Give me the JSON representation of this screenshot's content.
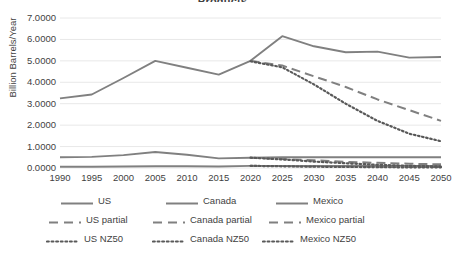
{
  "chart_data": {
    "type": "line",
    "title": "Products",
    "xlabel": "",
    "ylabel": "Billion Barrels/Year",
    "x": [
      1990,
      1995,
      2000,
      2005,
      2010,
      2015,
      2020,
      2025,
      2030,
      2035,
      2040,
      2045,
      2050
    ],
    "xtick_labels": [
      "1990",
      "1995",
      "2000",
      "2005",
      "2010",
      "2015",
      "2020",
      "2025",
      "2030",
      "2035",
      "2040",
      "2045",
      "2050"
    ],
    "ytick_labels": [
      "7.0000",
      "6.0000",
      "5.0000",
      "4.0000",
      "3.0000",
      "2.0000",
      "1.0000",
      "0.0000"
    ],
    "ytick_values": [
      7,
      6,
      5,
      4,
      3,
      2,
      1,
      0
    ],
    "ylim": [
      0,
      7
    ],
    "xlim": [
      1990,
      2050
    ],
    "grid": true,
    "legend_position": "bottom",
    "series": [
      {
        "name": "US",
        "style": "solid",
        "color": "#808080",
        "x": [
          1990,
          1995,
          2000,
          2005,
          2010,
          2015,
          2020,
          2025,
          2030,
          2035,
          2040,
          2045,
          2050
        ],
        "values": [
          3.25,
          3.43,
          4.2,
          5.0,
          4.68,
          4.36,
          5.0,
          6.15,
          5.68,
          5.4,
          5.43,
          5.15,
          5.18
        ]
      },
      {
        "name": "Canada",
        "style": "solid",
        "color": "#808080",
        "x": [
          1990,
          1995,
          2000,
          2005,
          2010,
          2015,
          2020,
          2025,
          2030,
          2035,
          2040,
          2045,
          2050
        ],
        "values": [
          0.5,
          0.52,
          0.6,
          0.75,
          0.62,
          0.45,
          0.48,
          0.5,
          0.5,
          0.5,
          0.5,
          0.5,
          0.5
        ]
      },
      {
        "name": "Mexico",
        "style": "solid",
        "color": "#808080",
        "x": [
          1990,
          1995,
          2000,
          2005,
          2010,
          2015,
          2020,
          2025,
          2030,
          2035,
          2040,
          2045,
          2050
        ],
        "values": [
          0.06,
          0.06,
          0.07,
          0.08,
          0.08,
          0.07,
          0.1,
          0.1,
          0.1,
          0.1,
          0.1,
          0.1,
          0.1
        ]
      },
      {
        "name": "US partial",
        "style": "dashed",
        "color": "#808080",
        "x": [
          2020,
          2025,
          2030,
          2035,
          2040,
          2045,
          2050
        ],
        "values": [
          5.0,
          4.78,
          4.28,
          3.78,
          3.2,
          2.7,
          2.2
        ]
      },
      {
        "name": "Canada partial",
        "style": "dashed",
        "color": "#808080",
        "x": [
          2020,
          2025,
          2030,
          2035,
          2040,
          2045,
          2050
        ],
        "values": [
          0.48,
          0.42,
          0.36,
          0.29,
          0.24,
          0.2,
          0.17
        ]
      },
      {
        "name": "Mexico partial",
        "style": "dashed",
        "color": "#808080",
        "x": [
          2020,
          2025,
          2030,
          2035,
          2040,
          2045,
          2050
        ],
        "values": [
          0.1,
          0.09,
          0.08,
          0.07,
          0.06,
          0.05,
          0.05
        ]
      },
      {
        "name": "US NZ50",
        "style": "dotted",
        "color": "#595959",
        "x": [
          2020,
          2025,
          2030,
          2035,
          2040,
          2045,
          2050
        ],
        "values": [
          4.98,
          4.7,
          3.9,
          3.0,
          2.2,
          1.6,
          1.25
        ]
      },
      {
        "name": "Canada NZ50",
        "style": "dotted",
        "color": "#595959",
        "x": [
          2020,
          2025,
          2030,
          2035,
          2040,
          2045,
          2050
        ],
        "values": [
          0.48,
          0.4,
          0.3,
          0.22,
          0.15,
          0.1,
          0.07
        ]
      },
      {
        "name": "Mexico NZ50",
        "style": "dotted",
        "color": "#595959",
        "x": [
          2020,
          2025,
          2030,
          2035,
          2040,
          2045,
          2050
        ],
        "values": [
          0.1,
          0.08,
          0.06,
          0.05,
          0.04,
          0.03,
          0.03
        ]
      }
    ],
    "legend": [
      {
        "label": "US",
        "style": "solid"
      },
      {
        "label": "Canada",
        "style": "solid"
      },
      {
        "label": "Mexico",
        "style": "solid"
      },
      {
        "label": "US partial",
        "style": "dashed"
      },
      {
        "label": "Canada partial",
        "style": "dashed"
      },
      {
        "label": "Mexico partial",
        "style": "dashed"
      },
      {
        "label": "US NZ50",
        "style": "dotted"
      },
      {
        "label": "Canada NZ50",
        "style": "dotted"
      },
      {
        "label": "Mexico NZ50",
        "style": "dotted"
      }
    ]
  },
  "colors": {
    "line": "#808080",
    "line_dotted": "#595959",
    "grid": "#e8e8e8",
    "text": "#3f3f3f",
    "background": "#ffffff"
  }
}
